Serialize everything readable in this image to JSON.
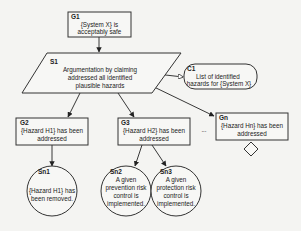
{
  "diagram": {
    "type": "GSN goal structure",
    "nodes": {
      "g1": {
        "id": "G1",
        "kind": "goal",
        "lines": [
          "{System X} is",
          "acceptably safe"
        ]
      },
      "s1": {
        "id": "S1",
        "kind": "strategy",
        "lines": [
          "Argumentation by claiming",
          "addressed all identified",
          "plausible hazards"
        ]
      },
      "c1": {
        "id": "C1",
        "kind": "context",
        "lines": [
          "List of identified",
          "hazards for {System X}"
        ]
      },
      "g2": {
        "id": "G2",
        "kind": "goal",
        "lines": [
          "{Hazard H1} has been",
          "addressed"
        ]
      },
      "g3": {
        "id": "G3",
        "kind": "goal",
        "lines": [
          "{Hazard H2} has been",
          "addressed"
        ]
      },
      "gn": {
        "id": "Gn",
        "kind": "goal (undeveloped)",
        "lines": [
          "{Hazard Hn} has been",
          "addressed"
        ]
      },
      "sn1": {
        "id": "Sn1",
        "kind": "solution",
        "lines": [
          "{Hazard H1} has",
          "been removed."
        ]
      },
      "sn2": {
        "id": "Sn2",
        "kind": "solution",
        "lines": [
          "A given",
          "prevention risk",
          "control is",
          "implemented."
        ]
      },
      "sn3": {
        "id": "Sn3",
        "kind": "solution",
        "lines": [
          "A given",
          "protection risk",
          "control is",
          "implemented."
        ]
      }
    },
    "ellipsis": "...",
    "edges": [
      {
        "from": "G1",
        "to": "S1",
        "type": "supported-by"
      },
      {
        "from": "S1",
        "to": "C1",
        "type": "in-context-of"
      },
      {
        "from": "S1",
        "to": "G2",
        "type": "supported-by"
      },
      {
        "from": "S1",
        "to": "G3",
        "type": "supported-by"
      },
      {
        "from": "S1",
        "to": "Gn",
        "type": "supported-by"
      },
      {
        "from": "G2",
        "to": "Sn1",
        "type": "supported-by"
      },
      {
        "from": "G3",
        "to": "Sn2",
        "type": "supported-by"
      },
      {
        "from": "G3",
        "to": "Sn3",
        "type": "supported-by"
      }
    ]
  }
}
